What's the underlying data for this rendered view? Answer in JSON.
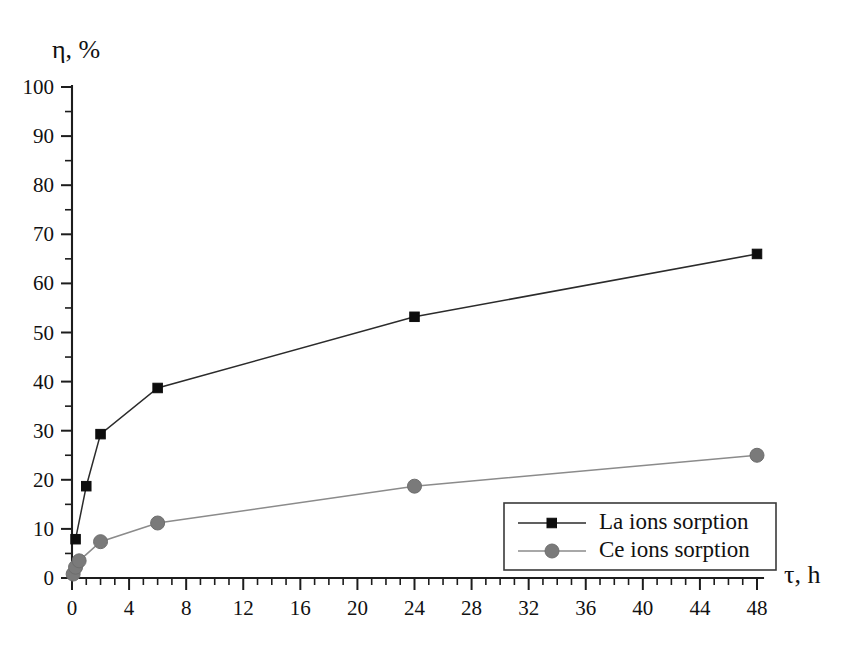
{
  "chart_data": {
    "type": "line",
    "title": "",
    "xlabel": "τ, h",
    "ylabel": "η, %",
    "xlim": [
      0,
      48
    ],
    "ylim": [
      0,
      100
    ],
    "grid": false,
    "legend_position": "bottom-right",
    "x_ticks": [
      0,
      4,
      8,
      12,
      16,
      20,
      24,
      28,
      32,
      36,
      40,
      44,
      48
    ],
    "x_tick_labels": [
      "0",
      "4",
      "8",
      "12",
      "16",
      "20",
      "24",
      "28",
      "32",
      "36",
      "40",
      "44",
      "48"
    ],
    "x_minor_step": 1,
    "y_ticks": [
      0,
      10,
      20,
      30,
      40,
      50,
      60,
      70,
      80,
      90,
      100
    ],
    "y_tick_labels": [
      "0",
      "10",
      "20",
      "30",
      "40",
      "50",
      "60",
      "70",
      "80",
      "90",
      "100"
    ],
    "y_minor_step": 5,
    "series": [
      {
        "name": "La ions sorption",
        "marker": "square",
        "color": "#0d0d0d",
        "line_color": "#2b2b2b",
        "points": [
          [
            0.25,
            7.9
          ],
          [
            1.0,
            18.7
          ],
          [
            2.0,
            29.3
          ],
          [
            6.0,
            38.7
          ],
          [
            24.0,
            53.2
          ],
          [
            48.0,
            66.0
          ]
        ]
      },
      {
        "name": "Ce ions sorption",
        "marker": "circle",
        "color": "#7a7a7a",
        "line_color": "#8b8b8b",
        "points": [
          [
            0.08,
            0.8
          ],
          [
            0.25,
            2.2
          ],
          [
            0.5,
            3.5
          ],
          [
            2.0,
            7.4
          ],
          [
            6.0,
            11.2
          ],
          [
            24.0,
            18.7
          ],
          [
            48.0,
            25.0
          ]
        ]
      }
    ]
  },
  "legend": {
    "entries": [
      {
        "label": "La ions sorption"
      },
      {
        "label": "Ce ions sorption"
      }
    ]
  }
}
